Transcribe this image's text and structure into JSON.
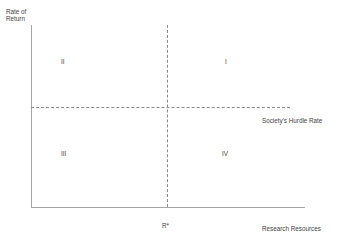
{
  "chart_data": {
    "type": "scatter",
    "title": "",
    "xlabel": "Research Resources",
    "ylabel": "Rate of\nReturn",
    "grid": false,
    "legend": "none",
    "axes": {
      "x_axis_label": "Research Resources",
      "y_axis_label_line1": "Rate of",
      "y_axis_label_line2": "Return"
    },
    "reference_lines": [
      {
        "name": "societys-hurdle-rate",
        "orientation": "horizontal",
        "style": "dashed",
        "label": "Society's Hurdle Rate"
      },
      {
        "name": "r-star",
        "orientation": "vertical",
        "style": "dashed",
        "label": "R*"
      }
    ],
    "quadrants": [
      {
        "id": "I",
        "label": "I",
        "position": "upper-right"
      },
      {
        "id": "II",
        "label": "II",
        "position": "upper-left"
      },
      {
        "id": "III",
        "label": "III",
        "position": "lower-left"
      },
      {
        "id": "IV",
        "label": "IV",
        "position": "lower-right"
      }
    ],
    "colors": {
      "axis": "#a6a6a6",
      "dashed_line": "#8a8a8a",
      "text": "#3f3f3f",
      "background": "#ffffff"
    }
  }
}
